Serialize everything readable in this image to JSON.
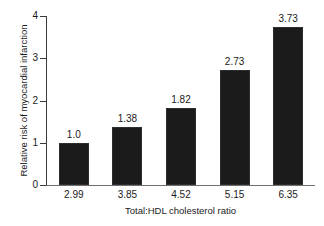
{
  "chart_data": {
    "type": "bar",
    "title": "",
    "xlabel": "Total:HDL cholesterol ratio",
    "ylabel": "Relative risk of myocardial infarction",
    "categories": [
      "2.99",
      "3.85",
      "4.52",
      "5.15",
      "6.35"
    ],
    "values": [
      1.0,
      1.38,
      1.82,
      2.73,
      3.73
    ],
    "data_labels": [
      "1.0",
      "1.38",
      "1.82",
      "2.73",
      "3.73"
    ],
    "ylim": [
      0,
      4
    ],
    "yticks": [
      0,
      1,
      2,
      3,
      4
    ],
    "ytick_labels": [
      "0",
      "1",
      "2",
      "3",
      "4"
    ],
    "grid": false,
    "legend": false,
    "bar_color": "#1b1b1b",
    "axis_color": "#3a3a3a",
    "background_color": "#ffffff"
  }
}
